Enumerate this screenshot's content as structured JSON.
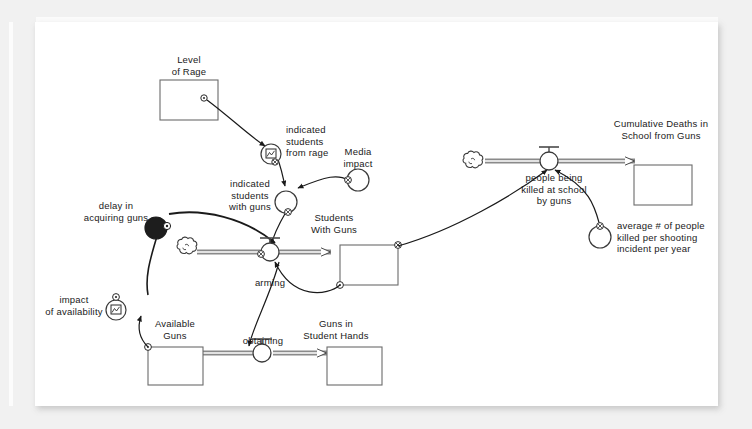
{
  "canvas": {
    "background": "#f1f1f1",
    "paper": "#ffffff",
    "ink": "#2b2b2b"
  },
  "diagram": {
    "stocks": [
      {
        "id": "level_of_rage",
        "label": "Level\nof Rage",
        "x": 160,
        "y": 78,
        "w": 58,
        "h": 40,
        "label_x": 189,
        "label_y": 42
      },
      {
        "id": "students_with_guns",
        "label": "Students\nWith Guns",
        "x": 340,
        "y": 243,
        "w": 58,
        "h": 40,
        "label_x": 369,
        "label_y": 212
      },
      {
        "id": "available_guns",
        "label": "Available\nGuns",
        "x": 148,
        "y": 345,
        "w": 55,
        "h": 38,
        "label_x": 175,
        "label_y": 311
      },
      {
        "id": "guns_in_student_hands",
        "label": "Guns in\nStudent Hands",
        "x": 327,
        "y": 345,
        "w": 55,
        "h": 38,
        "label_x": 354,
        "label_y": 311
      },
      {
        "id": "cumulative_deaths",
        "label": "Cumulative Deaths in\nSchool from Guns",
        "x": 634,
        "y": 163,
        "w": 58,
        "h": 40,
        "label_x": 662,
        "label_y": 124
      }
    ],
    "converters": [
      {
        "id": "indicated_students_from_rage",
        "label": "indicated\nstudents\nfrom rage",
        "kind": "lookup",
        "cx": 271,
        "cy": 152,
        "r": 10,
        "label_x": 311,
        "label_y": 128,
        "align": "left"
      },
      {
        "id": "indicated_students_with_guns",
        "label": "indicated\nstudents\nwith guns",
        "kind": "plain",
        "cx": 286,
        "cy": 200,
        "r": 11,
        "label_x": 268,
        "label_y": 182,
        "align": "right"
      },
      {
        "id": "media_impact",
        "label": "Media\nimpact",
        "kind": "plain",
        "cx": 358,
        "cy": 178,
        "r": 11,
        "label_x": 358,
        "label_y": 150,
        "align": "center"
      },
      {
        "id": "delay_in_acquiring_guns",
        "label": "delay in\nacquiring guns",
        "kind": "filled",
        "cx": 156,
        "cy": 226,
        "r": 11,
        "label_x": 150,
        "label_y": 204,
        "align": "right"
      },
      {
        "id": "impact_of_availability",
        "label": "impact\nof availability",
        "kind": "lookup",
        "cx": 116,
        "cy": 288,
        "r": 10,
        "label_x": 108,
        "label_y": 269,
        "align": "right"
      },
      {
        "id": "average_killed",
        "label": "average # of people\nkilled per shooting\nincident per year",
        "kind": "plain",
        "cx": 600,
        "cy": 231,
        "r": 11,
        "label_x": 620,
        "label_y": 213,
        "align": "left"
      }
    ],
    "flows": [
      {
        "id": "arming",
        "label": "arming",
        "cx": 270,
        "cy": 265,
        "label_x": 270,
        "label_y": 283
      },
      {
        "id": "obtaining",
        "label": "obtaining",
        "cx": 262,
        "cy": 366,
        "label_x": 262,
        "label_y": 344
      },
      {
        "id": "people_being_killed",
        "label": "people being\nkilled at school\nby guns",
        "cx": 549,
        "cy": 174,
        "label_x": 549,
        "label_y": 186
      }
    ],
    "clouds": [
      {
        "id": "arming_source",
        "cx": 190,
        "cy": 265
      },
      {
        "id": "killing_source",
        "cx": 476,
        "cy": 174
      }
    ]
  }
}
